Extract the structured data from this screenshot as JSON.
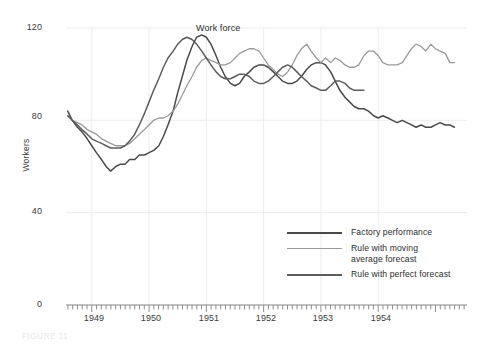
{
  "chart_data": {
    "type": "line",
    "title": "",
    "xlabel": "",
    "ylabel": "Workers",
    "ylim": [
      0,
      120
    ],
    "yticks": [
      0,
      40,
      80,
      120
    ],
    "xlim": [
      1948.55,
      1955.55
    ],
    "xticks": [
      1949,
      1950,
      1951,
      1952,
      1953,
      1954
    ],
    "xticklabels": [
      "1949",
      "1950",
      "1951",
      "1952",
      "1953",
      "1954"
    ],
    "grid": true,
    "grid_axis": "both",
    "minor_xticks": "monthly",
    "legend_position": "lower-right-inside",
    "annotations": [
      {
        "text": "Work force",
        "x": 1950.72,
        "y": 120.5
      }
    ],
    "series": [
      {
        "name": "Factory performance",
        "color": "#4a4a4a",
        "width": 1.5,
        "points": [
          [
            1948.58,
            84
          ],
          [
            1948.66,
            80
          ],
          [
            1948.75,
            77
          ],
          [
            1948.83,
            75
          ],
          [
            1948.92,
            72
          ],
          [
            1949.0,
            69
          ],
          [
            1949.08,
            66
          ],
          [
            1949.17,
            63
          ],
          [
            1949.25,
            60
          ],
          [
            1949.33,
            58
          ],
          [
            1949.42,
            60
          ],
          [
            1949.5,
            61
          ],
          [
            1949.58,
            61
          ],
          [
            1949.66,
            63
          ],
          [
            1949.75,
            63
          ],
          [
            1949.83,
            65
          ],
          [
            1949.92,
            65
          ],
          [
            1950.0,
            66
          ],
          [
            1950.08,
            67
          ],
          [
            1950.17,
            69
          ],
          [
            1950.25,
            73
          ],
          [
            1950.33,
            78
          ],
          [
            1950.42,
            84
          ],
          [
            1950.5,
            92
          ],
          [
            1950.58,
            99
          ],
          [
            1950.66,
            106
          ],
          [
            1950.75,
            112
          ],
          [
            1950.83,
            116
          ],
          [
            1950.92,
            117
          ],
          [
            1951.0,
            116
          ],
          [
            1951.08,
            113
          ],
          [
            1951.17,
            108
          ],
          [
            1951.25,
            103
          ],
          [
            1951.33,
            99
          ],
          [
            1951.42,
            96
          ],
          [
            1951.5,
            95
          ],
          [
            1951.58,
            96
          ],
          [
            1951.66,
            99
          ],
          [
            1951.75,
            101
          ],
          [
            1951.83,
            103
          ],
          [
            1951.92,
            104
          ],
          [
            1952.0,
            104
          ],
          [
            1952.08,
            103
          ],
          [
            1952.17,
            101
          ],
          [
            1952.25,
            99
          ],
          [
            1952.33,
            97
          ],
          [
            1952.42,
            96
          ],
          [
            1952.5,
            96
          ],
          [
            1952.58,
            97
          ],
          [
            1952.66,
            99
          ],
          [
            1952.75,
            102
          ],
          [
            1952.83,
            104
          ],
          [
            1952.92,
            105
          ],
          [
            1953.0,
            105
          ],
          [
            1953.08,
            104
          ],
          [
            1953.17,
            101
          ],
          [
            1953.25,
            97
          ],
          [
            1953.33,
            93
          ],
          [
            1953.42,
            90
          ],
          [
            1953.5,
            88
          ],
          [
            1953.58,
            86
          ],
          [
            1953.66,
            85
          ],
          [
            1953.75,
            85
          ],
          [
            1953.83,
            84
          ],
          [
            1953.92,
            82
          ],
          [
            1954.0,
            81
          ],
          [
            1954.08,
            82
          ],
          [
            1954.17,
            81
          ],
          [
            1954.25,
            80
          ],
          [
            1954.33,
            79
          ],
          [
            1954.42,
            80
          ],
          [
            1954.5,
            79
          ],
          [
            1954.58,
            78
          ],
          [
            1954.66,
            77
          ],
          [
            1954.75,
            78
          ],
          [
            1954.83,
            77
          ],
          [
            1954.92,
            77
          ],
          [
            1955.0,
            78
          ],
          [
            1955.08,
            79
          ],
          [
            1955.17,
            78
          ],
          [
            1955.25,
            78
          ],
          [
            1955.33,
            77
          ]
        ]
      },
      {
        "name": "Rule with moving average forecast",
        "color": "#9a9a9a",
        "width": 1.3,
        "points": [
          [
            1948.58,
            82
          ],
          [
            1948.66,
            80
          ],
          [
            1948.75,
            79
          ],
          [
            1948.83,
            78
          ],
          [
            1948.92,
            76
          ],
          [
            1949.0,
            75
          ],
          [
            1949.08,
            74
          ],
          [
            1949.17,
            72
          ],
          [
            1949.25,
            71
          ],
          [
            1949.33,
            70
          ],
          [
            1949.42,
            69
          ],
          [
            1949.5,
            69
          ],
          [
            1949.58,
            69
          ],
          [
            1949.66,
            70
          ],
          [
            1949.75,
            72
          ],
          [
            1949.83,
            74
          ],
          [
            1949.92,
            76
          ],
          [
            1950.0,
            78
          ],
          [
            1950.08,
            80
          ],
          [
            1950.17,
            81
          ],
          [
            1950.25,
            81
          ],
          [
            1950.33,
            82
          ],
          [
            1950.42,
            84
          ],
          [
            1950.5,
            87
          ],
          [
            1950.58,
            91
          ],
          [
            1950.66,
            95
          ],
          [
            1950.75,
            99
          ],
          [
            1950.83,
            103
          ],
          [
            1950.92,
            106
          ],
          [
            1951.0,
            107
          ],
          [
            1951.08,
            106
          ],
          [
            1951.17,
            105
          ],
          [
            1951.25,
            104
          ],
          [
            1951.33,
            104
          ],
          [
            1951.42,
            105
          ],
          [
            1951.5,
            107
          ],
          [
            1951.58,
            109
          ],
          [
            1951.66,
            110
          ],
          [
            1951.75,
            111
          ],
          [
            1951.83,
            111
          ],
          [
            1951.92,
            110
          ],
          [
            1952.0,
            107
          ],
          [
            1952.08,
            104
          ],
          [
            1952.17,
            102
          ],
          [
            1952.25,
            100
          ],
          [
            1952.33,
            99
          ],
          [
            1952.42,
            101
          ],
          [
            1952.5,
            104
          ],
          [
            1952.58,
            108
          ],
          [
            1952.66,
            111
          ],
          [
            1952.75,
            113
          ],
          [
            1952.83,
            110
          ],
          [
            1952.92,
            107
          ],
          [
            1953.0,
            105
          ],
          [
            1953.08,
            107
          ],
          [
            1953.17,
            105
          ],
          [
            1953.25,
            107
          ],
          [
            1953.33,
            106
          ],
          [
            1953.42,
            104
          ],
          [
            1953.5,
            103
          ],
          [
            1953.58,
            103
          ],
          [
            1953.66,
            104
          ],
          [
            1953.75,
            108
          ],
          [
            1953.83,
            110
          ],
          [
            1953.92,
            110
          ],
          [
            1954.0,
            108
          ],
          [
            1954.08,
            105
          ],
          [
            1954.17,
            104
          ],
          [
            1954.25,
            104
          ],
          [
            1954.33,
            104
          ],
          [
            1954.42,
            105
          ],
          [
            1954.5,
            108
          ],
          [
            1954.58,
            111
          ],
          [
            1954.66,
            113
          ],
          [
            1954.75,
            112
          ],
          [
            1954.83,
            110
          ],
          [
            1954.92,
            113
          ],
          [
            1955.0,
            111
          ],
          [
            1955.08,
            110
          ],
          [
            1955.17,
            109
          ],
          [
            1955.25,
            105
          ],
          [
            1955.33,
            105
          ]
        ]
      },
      {
        "name": "Rule with perfect forecast",
        "color": "#5d5d5d",
        "width": 1.5,
        "points": [
          [
            1948.58,
            82
          ],
          [
            1948.66,
            80
          ],
          [
            1948.75,
            78
          ],
          [
            1948.83,
            76
          ],
          [
            1948.92,
            74
          ],
          [
            1949.0,
            72
          ],
          [
            1949.08,
            71
          ],
          [
            1949.17,
            70
          ],
          [
            1949.25,
            69
          ],
          [
            1949.33,
            68
          ],
          [
            1949.42,
            68
          ],
          [
            1949.5,
            68
          ],
          [
            1949.58,
            69
          ],
          [
            1949.66,
            71
          ],
          [
            1949.75,
            74
          ],
          [
            1949.83,
            78
          ],
          [
            1949.92,
            83
          ],
          [
            1950.0,
            88
          ],
          [
            1950.08,
            93
          ],
          [
            1950.17,
            98
          ],
          [
            1950.25,
            103
          ],
          [
            1950.33,
            107
          ],
          [
            1950.42,
            110
          ],
          [
            1950.5,
            113
          ],
          [
            1950.58,
            115
          ],
          [
            1950.66,
            116
          ],
          [
            1950.75,
            115
          ],
          [
            1950.83,
            113
          ],
          [
            1950.92,
            110
          ],
          [
            1951.0,
            107
          ],
          [
            1951.08,
            104
          ],
          [
            1951.17,
            101
          ],
          [
            1951.25,
            99
          ],
          [
            1951.33,
            98
          ],
          [
            1951.42,
            98
          ],
          [
            1951.5,
            99
          ],
          [
            1951.58,
            100
          ],
          [
            1951.66,
            100
          ],
          [
            1951.75,
            99
          ],
          [
            1951.83,
            97
          ],
          [
            1951.92,
            96
          ],
          [
            1952.0,
            96
          ],
          [
            1952.08,
            97
          ],
          [
            1952.17,
            99
          ],
          [
            1952.25,
            101
          ],
          [
            1952.33,
            103
          ],
          [
            1952.42,
            104
          ],
          [
            1952.5,
            103
          ],
          [
            1952.58,
            101
          ],
          [
            1952.66,
            99
          ],
          [
            1952.75,
            97
          ],
          [
            1952.83,
            95
          ],
          [
            1952.92,
            94
          ],
          [
            1953.0,
            93
          ],
          [
            1953.08,
            93
          ],
          [
            1953.17,
            95
          ],
          [
            1953.25,
            97
          ],
          [
            1953.33,
            97
          ],
          [
            1953.42,
            96
          ],
          [
            1953.5,
            94
          ],
          [
            1953.58,
            93
          ],
          [
            1953.66,
            93
          ],
          [
            1953.75,
            93
          ]
        ]
      }
    ]
  },
  "axes": {
    "ylabel": "Workers",
    "yticklabels": [
      "0",
      "40",
      "80",
      "120"
    ],
    "xticklabels": [
      "1949",
      "1950",
      "1951",
      "1952",
      "1953",
      "1954"
    ]
  },
  "annotation": {
    "work_force": "Work force"
  },
  "legend": {
    "items": [
      {
        "label": "Factory performance",
        "color": "#4a4a4a"
      },
      {
        "label": "Rule with moving\naverage forecast",
        "color": "#9a9a9a"
      },
      {
        "label": "Rule with perfect forecast",
        "color": "#5d5d5d"
      }
    ]
  },
  "caption": {
    "text": "FIGURE 11"
  },
  "colors": {
    "grid": "#ededed",
    "axis": "#8e8e8e",
    "text": "#3b3b3b",
    "background": "#ffffff"
  }
}
